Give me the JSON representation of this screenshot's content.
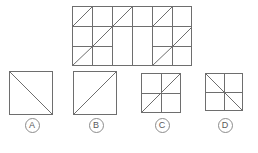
{
  "puzzle": {
    "type": "visual-pattern-matrix",
    "colors": {
      "line": "#6e6e6e",
      "border": "#6e6e6e",
      "background": "#ffffff",
      "label_text": "#5a5a5a",
      "label_border": "#8c8c8c"
    },
    "main_figure": {
      "name": "main-pattern-grid",
      "x": 72,
      "y": 6,
      "width": 120,
      "height": 60,
      "cols": 6,
      "rows": 3,
      "cell_width": 20,
      "cell_height": 20,
      "description": "Rectangular 6 by 3 grid of square cells with diagonal lines, blank 2x2 region in the center",
      "cells": [
        {
          "col": 0,
          "row": 0,
          "diagonal": "slash"
        },
        {
          "col": 1,
          "row": 0,
          "diagonal": "none"
        },
        {
          "col": 2,
          "row": 0,
          "diagonal": "slash"
        },
        {
          "col": 3,
          "row": 0,
          "diagonal": "none"
        },
        {
          "col": 4,
          "row": 0,
          "diagonal": "slash"
        },
        {
          "col": 5,
          "row": 0,
          "diagonal": "none"
        },
        {
          "col": 0,
          "row": 1,
          "diagonal": "none"
        },
        {
          "col": 1,
          "row": 1,
          "diagonal": "slash"
        },
        {
          "col": 2,
          "row": 1,
          "diagonal": "blank"
        },
        {
          "col": 3,
          "row": 1,
          "diagonal": "blank"
        },
        {
          "col": 4,
          "row": 1,
          "diagonal": "none"
        },
        {
          "col": 5,
          "row": 1,
          "diagonal": "slash"
        },
        {
          "col": 0,
          "row": 2,
          "diagonal": "slash"
        },
        {
          "col": 1,
          "row": 2,
          "diagonal": "none"
        },
        {
          "col": 2,
          "row": 2,
          "diagonal": "blank"
        },
        {
          "col": 3,
          "row": 2,
          "diagonal": "blank"
        },
        {
          "col": 4,
          "row": 2,
          "diagonal": "slash"
        },
        {
          "col": 5,
          "row": 2,
          "diagonal": "none"
        }
      ],
      "internal_lines": {
        "vertical_x": [
          20,
          40,
          60,
          80,
          100
        ],
        "horizontal_y": [
          20,
          40
        ]
      }
    },
    "options": [
      {
        "id": "A",
        "label": "A",
        "name": "option-a",
        "box": {
          "size": 44
        },
        "diagonals": [
          {
            "kind": "backslash-full"
          },
          {
            "kind": "backslash-corner-top-left"
          }
        ],
        "subdivisions": "none",
        "description": "Square with a full top-left to bottom-right diagonal plus a short parallel diagonal near the top-left corner"
      },
      {
        "id": "B",
        "label": "B",
        "name": "option-b",
        "box": {
          "size": 44
        },
        "diagonals": [
          {
            "kind": "slash-full"
          }
        ],
        "subdivisions": "none",
        "description": "Square with a single bottom-left to top-right diagonal"
      },
      {
        "id": "C",
        "label": "C",
        "name": "option-c",
        "box": {
          "size": 40
        },
        "diagonals": [
          {
            "kind": "slash-full"
          }
        ],
        "subdivisions": "2x2",
        "description": "Square divided into 2 by 2 cells with a bottom-left to top-right diagonal"
      },
      {
        "id": "D",
        "label": "D",
        "name": "option-d",
        "box": {
          "size": 38
        },
        "diagonals": [
          {
            "kind": "backslash-full"
          }
        ],
        "subdivisions": "2x2",
        "description": "Square divided into 2 by 2 cells with a top-left to bottom-right diagonal"
      }
    ]
  }
}
